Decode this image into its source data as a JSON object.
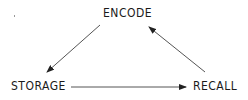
{
  "diagram": {
    "type": "cycle",
    "nodes": [
      {
        "id": "encode",
        "label": "ENCODE"
      },
      {
        "id": "storage",
        "label": "STORAGE"
      },
      {
        "id": "recall",
        "label": "RECALL"
      }
    ],
    "edges": [
      {
        "from": "encode",
        "to": "storage"
      },
      {
        "from": "storage",
        "to": "recall"
      },
      {
        "from": "recall",
        "to": "encode"
      }
    ],
    "colors": {
      "text": "#1a1a1a",
      "arrow": "#333333",
      "background": "#ffffff"
    }
  }
}
